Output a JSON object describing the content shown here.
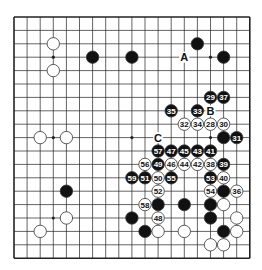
{
  "board": {
    "size": 19,
    "origin_x": 14,
    "origin_y": 17,
    "step_x": 13.1,
    "step_y": 13.4,
    "stone_radius": 6.2,
    "colors": {
      "line": "#222222",
      "black": "#111111",
      "white": "#ffffff",
      "stone_stroke": "#333333",
      "background": "#ffffff"
    },
    "star_points": [
      [
        3,
        3
      ],
      [
        9,
        3
      ],
      [
        15,
        3
      ],
      [
        3,
        9
      ],
      [
        9,
        9
      ],
      [
        15,
        9
      ],
      [
        3,
        15
      ],
      [
        9,
        15
      ],
      [
        15,
        15
      ]
    ],
    "stones": [
      {
        "c": 3,
        "r": 2,
        "color": "white"
      },
      {
        "c": 3,
        "r": 4,
        "color": "white"
      },
      {
        "c": 6,
        "r": 3,
        "color": "black"
      },
      {
        "c": 9,
        "r": 3,
        "color": "black"
      },
      {
        "c": 14,
        "r": 2,
        "color": "black"
      },
      {
        "c": 16,
        "r": 3,
        "color": "black"
      },
      {
        "c": 2,
        "r": 9,
        "color": "white"
      },
      {
        "c": 4,
        "r": 9,
        "color": "white"
      },
      {
        "c": 4,
        "r": 13,
        "color": "black"
      },
      {
        "c": 4,
        "r": 15,
        "color": "white"
      },
      {
        "c": 2,
        "r": 16,
        "color": "white"
      },
      {
        "c": 15,
        "r": 6,
        "color": "black",
        "label": "29"
      },
      {
        "c": 16,
        "r": 6,
        "color": "black",
        "label": "37"
      },
      {
        "c": 12,
        "r": 7,
        "color": "black",
        "label": "35"
      },
      {
        "c": 14,
        "r": 7,
        "color": "black",
        "label": "33"
      },
      {
        "c": 13,
        "r": 8,
        "color": "white",
        "label": "32"
      },
      {
        "c": 14,
        "r": 8,
        "color": "white",
        "label": "34"
      },
      {
        "c": 15,
        "r": 8,
        "color": "white",
        "label": "28"
      },
      {
        "c": 16,
        "r": 8,
        "color": "white",
        "label": "30"
      },
      {
        "c": 16,
        "r": 9,
        "color": "black"
      },
      {
        "c": 17,
        "r": 9,
        "color": "black",
        "label": "31"
      },
      {
        "c": 11,
        "r": 10,
        "color": "black",
        "label": "57"
      },
      {
        "c": 12,
        "r": 10,
        "color": "black",
        "label": "47"
      },
      {
        "c": 13,
        "r": 10,
        "color": "black",
        "label": "45"
      },
      {
        "c": 14,
        "r": 10,
        "color": "black",
        "label": "43"
      },
      {
        "c": 15,
        "r": 10,
        "color": "black",
        "label": "41"
      },
      {
        "c": 10,
        "r": 11,
        "color": "white",
        "label": "56"
      },
      {
        "c": 11,
        "r": 11,
        "color": "black",
        "label": "49"
      },
      {
        "c": 12,
        "r": 11,
        "color": "white",
        "label": "46"
      },
      {
        "c": 13,
        "r": 11,
        "color": "white",
        "label": "44"
      },
      {
        "c": 14,
        "r": 11,
        "color": "white",
        "label": "42"
      },
      {
        "c": 15,
        "r": 11,
        "color": "white",
        "label": "38"
      },
      {
        "c": 16,
        "r": 11,
        "color": "black",
        "label": "39"
      },
      {
        "c": 9,
        "r": 12,
        "color": "black",
        "label": "59"
      },
      {
        "c": 10,
        "r": 12,
        "color": "black",
        "label": "51"
      },
      {
        "c": 11,
        "r": 12,
        "color": "white",
        "label": "50"
      },
      {
        "c": 12,
        "r": 12,
        "color": "black",
        "label": "55"
      },
      {
        "c": 15,
        "r": 12,
        "color": "black",
        "label": "53"
      },
      {
        "c": 16,
        "r": 12,
        "color": "white",
        "label": "40"
      },
      {
        "c": 11,
        "r": 13,
        "color": "white",
        "label": "52"
      },
      {
        "c": 15,
        "r": 13,
        "color": "white",
        "label": "54"
      },
      {
        "c": 16,
        "r": 13,
        "color": "black"
      },
      {
        "c": 17,
        "r": 13,
        "color": "white",
        "label": "36"
      },
      {
        "c": 10,
        "r": 14,
        "color": "white",
        "label": "58"
      },
      {
        "c": 11,
        "r": 14,
        "color": "black"
      },
      {
        "c": 13,
        "r": 14,
        "color": "black"
      },
      {
        "c": 15,
        "r": 14,
        "color": "black"
      },
      {
        "c": 16,
        "r": 14,
        "color": "white"
      },
      {
        "c": 9,
        "r": 15,
        "color": "black"
      },
      {
        "c": 11,
        "r": 15,
        "color": "white",
        "label": "48"
      },
      {
        "c": 15,
        "r": 15,
        "color": "black"
      },
      {
        "c": 17,
        "r": 15,
        "color": "white"
      },
      {
        "c": 10,
        "r": 16,
        "color": "black"
      },
      {
        "c": 11,
        "r": 16,
        "color": "white"
      },
      {
        "c": 13,
        "r": 16,
        "color": "white"
      },
      {
        "c": 16,
        "r": 16,
        "color": "black"
      },
      {
        "c": 17,
        "r": 16,
        "color": "white"
      },
      {
        "c": 15,
        "r": 17,
        "color": "white"
      },
      {
        "c": 16,
        "r": 17,
        "color": "white"
      }
    ],
    "markers": [
      {
        "c": 13,
        "r": 3,
        "text": "A"
      },
      {
        "c": 15,
        "r": 7,
        "text": "B"
      },
      {
        "c": 11,
        "r": 9,
        "text": "C"
      }
    ]
  }
}
